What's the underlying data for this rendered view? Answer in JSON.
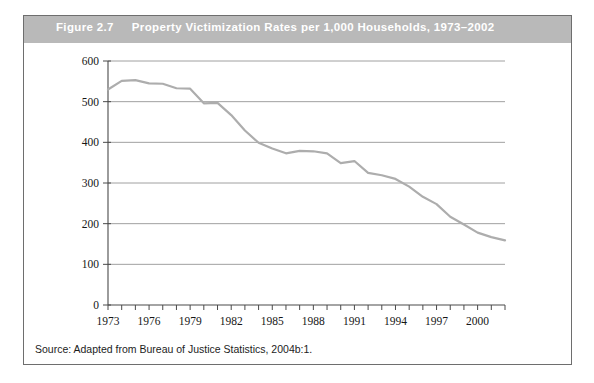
{
  "figure": {
    "number": "Figure 2.7",
    "title": "Property Victimization Rates per 1,000 Households, 1973–2002",
    "source_note": "Source: Adapted from Bureau of Justice Statistics, 2004b:1.",
    "header_bg": "#b9b9b9",
    "header_text_color": "#ffffff",
    "line_color": "#adadad",
    "grid_color": "#a0a0a0",
    "axis_color": "#4a4a4a",
    "border_color": "#6e6e6e"
  },
  "chart_data": {
    "type": "line",
    "title": "Property Victimization Rates per 1,000 Households, 1973–2002",
    "xlabel": "",
    "ylabel": "",
    "x": [
      1973,
      1974,
      1975,
      1976,
      1977,
      1978,
      1979,
      1980,
      1981,
      1982,
      1983,
      1984,
      1985,
      1986,
      1987,
      1988,
      1989,
      1990,
      1991,
      1992,
      1993,
      1994,
      1995,
      1996,
      1997,
      1998,
      1999,
      2000,
      2001,
      2002
    ],
    "values": [
      530,
      551,
      553,
      545,
      544,
      533,
      532,
      496,
      497,
      467,
      429,
      399,
      385,
      373,
      379,
      378,
      373,
      349,
      354,
      325,
      319,
      310,
      291,
      266,
      248,
      217,
      198,
      178,
      167,
      159
    ],
    "series": [
      {
        "name": "Property victimization rate per 1,000 households",
        "values": [
          530,
          551,
          553,
          545,
          544,
          533,
          532,
          496,
          497,
          467,
          429,
          399,
          385,
          373,
          379,
          378,
          373,
          349,
          354,
          325,
          319,
          310,
          291,
          266,
          248,
          217,
          198,
          178,
          167,
          159
        ]
      }
    ],
    "xlim": [
      1973,
      2002
    ],
    "ylim": [
      0,
      600
    ],
    "yticks": [
      0,
      100,
      200,
      300,
      400,
      500,
      600
    ],
    "ytick_labels": [
      "0",
      "100",
      "200",
      "300",
      "400",
      "500",
      "600"
    ],
    "xticks": [
      1973,
      1976,
      1979,
      1982,
      1985,
      1988,
      1991,
      1994,
      1997,
      2000
    ],
    "xtick_labels": [
      "1973",
      "1976",
      "1979",
      "1982",
      "1985",
      "1988",
      "1991",
      "1994",
      "1997",
      "2000"
    ],
    "grid": "horizontal",
    "legend": "none"
  }
}
